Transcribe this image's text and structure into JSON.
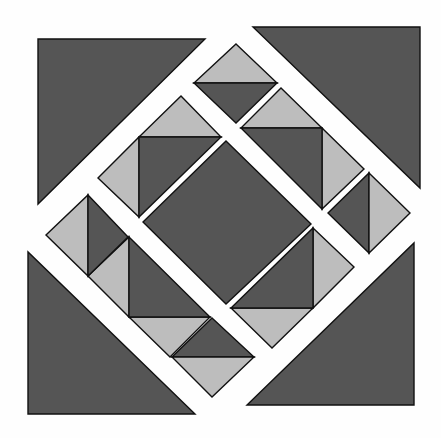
{
  "diagram": {
    "type": "quilt-block-pattern",
    "width": 441,
    "height": 438,
    "colors": {
      "background": "#fefefe",
      "dark": "#555555",
      "light": "#bdbdbd",
      "stroke": "#111111"
    },
    "corner_triangles": [
      {
        "name": "corner-triangle-top-left",
        "fill": "dark",
        "points": "38,39 205,39 38,204"
      },
      {
        "name": "corner-triangle-top-right",
        "fill": "dark",
        "points": "253,27 420,27 420,188"
      },
      {
        "name": "corner-triangle-bottom-left",
        "fill": "dark",
        "points": "28,252 28,414 195,414"
      },
      {
        "name": "corner-triangle-bottom-right",
        "fill": "dark",
        "points": "414,243 414,405 247,405"
      }
    ],
    "center_square": {
      "name": "center-diamond",
      "fill": "dark",
      "points": "226,141 311,224 226,304 143,222"
    },
    "small_diamonds": [
      {
        "name": "top-diamond",
        "halves": [
          {
            "fill": "light",
            "points": "236,44 277,83 194,83"
          },
          {
            "fill": "dark",
            "points": "194,83 277,83 236,123"
          }
        ]
      },
      {
        "name": "right-diamond",
        "halves": [
          {
            "fill": "dark",
            "points": "369,173 369,253 328,213"
          },
          {
            "fill": "light",
            "points": "369,173 410,213 369,253"
          }
        ]
      },
      {
        "name": "left-diamond",
        "halves": [
          {
            "fill": "light",
            "points": "88,195 88,276 46,235"
          },
          {
            "fill": "dark",
            "points": "88,195 128,237 88,276"
          }
        ]
      },
      {
        "name": "bottom-diamond",
        "halves": [
          {
            "fill": "dark",
            "points": "212,318 254,357 172,357"
          },
          {
            "fill": "light",
            "points": "172,357 254,357 212,397"
          }
        ]
      }
    ],
    "side_units": [
      {
        "name": "upper-left-unit",
        "pieces": [
          {
            "fill": "light",
            "points": "181,96 221,137 139,137"
          },
          {
            "fill": "light",
            "points": "139,137 139,217 98,178"
          },
          {
            "fill": "dark",
            "points": "139,137 221,137 139,217"
          }
        ]
      },
      {
        "name": "upper-right-unit",
        "pieces": [
          {
            "fill": "light",
            "points": "281,88 322,128 241,128"
          },
          {
            "fill": "light",
            "points": "322,128 364,169 322,209"
          },
          {
            "fill": "dark",
            "points": "241,128 322,128 322,209"
          }
        ]
      },
      {
        "name": "lower-left-unit",
        "pieces": [
          {
            "fill": "light",
            "points": "129,237 129,317 88,276"
          },
          {
            "fill": "light",
            "points": "129,317 210,317 170,357"
          },
          {
            "fill": "dark",
            "points": "129,237 210,317 129,317"
          }
        ]
      },
      {
        "name": "lower-right-unit",
        "pieces": [
          {
            "fill": "light",
            "points": "313,228 354,267 313,308"
          },
          {
            "fill": "light",
            "points": "231,308 313,308 272,348"
          },
          {
            "fill": "dark",
            "points": "313,228 313,308 231,308"
          }
        ]
      }
    ]
  }
}
